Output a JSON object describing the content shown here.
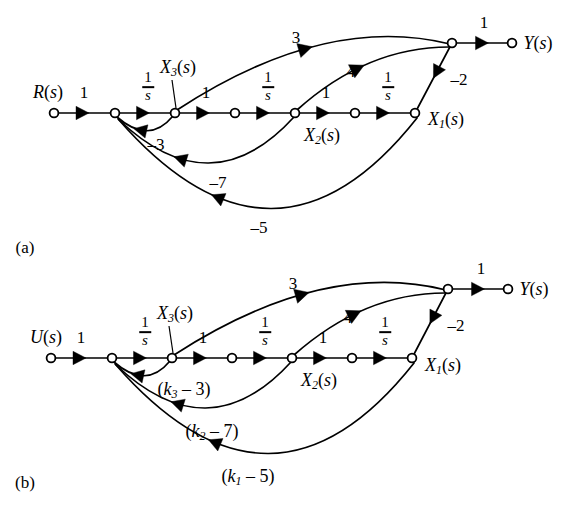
{
  "figure": {
    "background": "#ffffff",
    "ink_color": "#000000",
    "width": 586,
    "height": 517,
    "type": "signal-flow-graph",
    "panels": [
      {
        "id": "a",
        "caption": "(a)",
        "caption_pos": {
          "x": 25,
          "y": 247
        },
        "baseline_y": 113,
        "top_y": 43,
        "input_label": "R(s)",
        "input_label_pos": {
          "x": 48,
          "y": 92
        },
        "output_label": "Y(s)",
        "output_label_pos": {
          "x": 538,
          "y": 43
        },
        "nodes": [
          {
            "name": "input",
            "x": 54,
            "y": 113
          },
          {
            "name": "summing-junction",
            "x": 115,
            "y": 113
          },
          {
            "name": "x3",
            "x": 175,
            "y": 113
          },
          {
            "name": "mid-1",
            "x": 235,
            "y": 113
          },
          {
            "name": "x2",
            "x": 295,
            "y": 113
          },
          {
            "name": "mid-2",
            "x": 355,
            "y": 113
          },
          {
            "name": "x1",
            "x": 415,
            "y": 113
          },
          {
            "name": "output-junction",
            "x": 452,
            "y": 43
          },
          {
            "name": "output",
            "x": 512,
            "y": 43
          }
        ],
        "node_labels": [
          {
            "name": "x3-label",
            "text": "X3(s)",
            "base": "X",
            "sub": "3",
            "tail": "(s)",
            "x": 178,
            "y": 68,
            "anchor": "center",
            "leader": {
              "x1": 172,
              "y1": 80,
              "x2": 176,
              "y2": 108
            }
          },
          {
            "name": "x2-label",
            "text": "X2(s)",
            "base": "X",
            "sub": "2",
            "tail": "(s)",
            "x": 322,
            "y": 136,
            "anchor": "center"
          },
          {
            "name": "x1-label",
            "text": "X1(s)",
            "base": "X",
            "sub": "1",
            "tail": "(s)",
            "x": 446,
            "y": 120,
            "anchor": "center"
          }
        ],
        "gains": [
          {
            "name": "gain-input",
            "text": "1",
            "kind": "plain",
            "x": 84,
            "y": 92
          },
          {
            "name": "gain-integrator-3",
            "text": "1/s",
            "kind": "fraction",
            "num": "1",
            "den": "s",
            "x": 148,
            "y": 87
          },
          {
            "name": "gain-x3-to-mid1",
            "text": "1",
            "kind": "plain",
            "x": 206,
            "y": 92
          },
          {
            "name": "gain-integrator-2",
            "text": "1/s",
            "kind": "fraction",
            "num": "1",
            "den": "s",
            "x": 268,
            "y": 87
          },
          {
            "name": "gain-x2-to-mid2",
            "text": "1",
            "kind": "plain",
            "x": 326,
            "y": 92
          },
          {
            "name": "gain-integrator-1",
            "text": "1/s",
            "kind": "fraction",
            "num": "1",
            "den": "s",
            "x": 388,
            "y": 87
          },
          {
            "name": "gain-output",
            "text": "1",
            "kind": "plain",
            "x": 484,
            "y": 22
          },
          {
            "name": "gain-forward-3",
            "text": "3",
            "kind": "plain",
            "x": 296,
            "y": 37
          },
          {
            "name": "gain-forward-4",
            "text": "4",
            "kind": "plain",
            "x": 351,
            "y": 71
          },
          {
            "name": "gain-feedback-minus2",
            "text": "-2",
            "kind": "plain",
            "x": 459,
            "y": 79
          },
          {
            "name": "gain-feedback-minus3",
            "text": "-3",
            "kind": "plain",
            "x": 156,
            "y": 144
          },
          {
            "name": "gain-feedback-minus7",
            "text": "-7",
            "kind": "plain",
            "x": 218,
            "y": 182
          },
          {
            "name": "gain-feedback-minus5",
            "text": "-5",
            "kind": "plain",
            "x": 259,
            "y": 227
          }
        ]
      },
      {
        "id": "b",
        "caption": "(b)",
        "caption_pos": {
          "x": 25,
          "y": 482
        },
        "baseline_y": 358,
        "top_y": 289,
        "input_label": "U(s)",
        "input_label_pos": {
          "x": 46,
          "y": 337
        },
        "output_label": "Y(s)",
        "output_label_pos": {
          "x": 534,
          "y": 289
        },
        "nodes": [
          {
            "name": "input",
            "x": 51,
            "y": 358
          },
          {
            "name": "summing-junction",
            "x": 112,
            "y": 358
          },
          {
            "name": "x3",
            "x": 172,
            "y": 358
          },
          {
            "name": "mid-1",
            "x": 232,
            "y": 358
          },
          {
            "name": "x2",
            "x": 292,
            "y": 358
          },
          {
            "name": "mid-2",
            "x": 352,
            "y": 358
          },
          {
            "name": "x1",
            "x": 412,
            "y": 358
          },
          {
            "name": "output-junction",
            "x": 448,
            "y": 289
          },
          {
            "name": "output",
            "x": 508,
            "y": 289
          }
        ],
        "node_labels": [
          {
            "name": "x3-label",
            "text": "X3(s)",
            "base": "X",
            "sub": "3",
            "tail": "(s)",
            "x": 175,
            "y": 314,
            "anchor": "center",
            "leader": {
              "x1": 169,
              "y1": 326,
              "x2": 173,
              "y2": 353
            }
          },
          {
            "name": "x2-label",
            "text": "X2(s)",
            "base": "X",
            "sub": "2",
            "tail": "(s)",
            "x": 319,
            "y": 381,
            "anchor": "center"
          },
          {
            "name": "x1-label",
            "text": "X1(s)",
            "base": "X",
            "sub": "1",
            "tail": "(s)",
            "x": 443,
            "y": 366,
            "anchor": "center"
          }
        ],
        "gains": [
          {
            "name": "gain-input",
            "text": "1",
            "kind": "plain",
            "x": 81,
            "y": 337
          },
          {
            "name": "gain-integrator-3",
            "text": "1/s",
            "kind": "fraction",
            "num": "1",
            "den": "s",
            "x": 145,
            "y": 332
          },
          {
            "name": "gain-x3-to-mid1",
            "text": "1",
            "kind": "plain",
            "x": 203,
            "y": 337
          },
          {
            "name": "gain-integrator-2",
            "text": "1/s",
            "kind": "fraction",
            "num": "1",
            "den": "s",
            "x": 265,
            "y": 332
          },
          {
            "name": "gain-x2-to-mid2",
            "text": "1",
            "kind": "plain",
            "x": 323,
            "y": 337
          },
          {
            "name": "gain-integrator-1",
            "text": "1/s",
            "kind": "fraction",
            "num": "1",
            "den": "s",
            "x": 385,
            "y": 332
          },
          {
            "name": "gain-output",
            "text": "1",
            "kind": "plain",
            "x": 481,
            "y": 268
          },
          {
            "name": "gain-forward-3",
            "text": "3",
            "kind": "plain",
            "x": 293,
            "y": 283
          },
          {
            "name": "gain-forward-4",
            "text": "4",
            "kind": "plain",
            "x": 348,
            "y": 317
          },
          {
            "name": "gain-feedback-minus2",
            "text": "-2",
            "kind": "plain",
            "x": 456,
            "y": 325
          },
          {
            "name": "gain-feedback-k3",
            "text": "(k3 - 3)",
            "kind": "subscripted",
            "pre": "(k",
            "sub": "3",
            "post": " - 3)",
            "x": 184,
            "y": 390
          },
          {
            "name": "gain-feedback-k2",
            "text": "(k2 - 7)",
            "kind": "subscripted",
            "pre": "(k",
            "sub": "2",
            "post": " - 7)",
            "x": 212,
            "y": 432
          },
          {
            "name": "gain-feedback-k1",
            "text": "(k1 - 5)",
            "kind": "subscripted",
            "pre": "(k",
            "sub": "1",
            "post": " - 5)",
            "x": 248,
            "y": 477
          }
        ]
      }
    ]
  }
}
